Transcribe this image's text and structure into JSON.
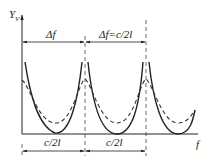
{
  "diagram": {
    "y_axis_label": "Y",
    "y_axis_subscript": "V",
    "x_axis_label": "f",
    "top_dimension_left": "Δf",
    "top_dimension_right": "Δf=c/2l",
    "bottom_dimension_left": "c/2l",
    "bottom_dimension_right": "c/2l",
    "curves": [
      {
        "name": "solid-curve",
        "style": "solid",
        "color": "#222222"
      },
      {
        "name": "dashed-curve",
        "style": "dashed",
        "color": "#222222"
      }
    ]
  }
}
